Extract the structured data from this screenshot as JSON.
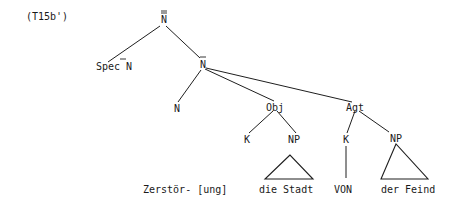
{
  "diagram": {
    "type": "syntax-tree",
    "label": "(T15b')",
    "nodes": {
      "root": {
        "text": "N",
        "bars": 2
      },
      "spec": {
        "text": "Spec N",
        "bars": 1
      },
      "nbar": {
        "text": "N",
        "bars": 1
      },
      "n": {
        "text": "N"
      },
      "obj": {
        "text": "Obj"
      },
      "agt": {
        "text": "Agt"
      },
      "obj_k": {
        "text": "K"
      },
      "obj_np": {
        "text": "NP"
      },
      "agt_k": {
        "text": "K"
      },
      "agt_np": {
        "text": "NP"
      }
    },
    "leaves": {
      "n_leaf": "Zerstör- [ung]",
      "obj_np_leaf": "die Stadt",
      "agt_k_leaf": "VON",
      "agt_np_leaf": "der Feind"
    },
    "edges": [
      [
        "root",
        "spec"
      ],
      [
        "root",
        "nbar"
      ],
      [
        "nbar",
        "n"
      ],
      [
        "nbar",
        "obj"
      ],
      [
        "nbar",
        "agt"
      ],
      [
        "obj",
        "obj_k"
      ],
      [
        "obj",
        "obj_np"
      ],
      [
        "agt",
        "agt_k"
      ],
      [
        "agt",
        "agt_np"
      ],
      [
        "agt_k",
        "agt_k_leaf"
      ]
    ],
    "triangles": [
      "obj_np",
      "agt_np"
    ]
  }
}
